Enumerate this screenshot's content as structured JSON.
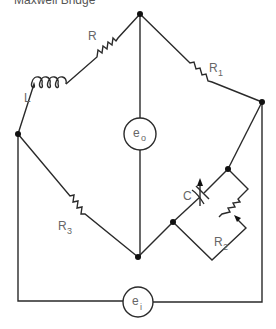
{
  "title": "Maxwell Bridge",
  "components": {
    "R": {
      "label": "R"
    },
    "L": {
      "label": "L"
    },
    "R1": {
      "label": "R",
      "sub": "1"
    },
    "R2": {
      "label": "R",
      "sub": "2"
    },
    "R3": {
      "label": "R",
      "sub": "3"
    },
    "C": {
      "label": "C"
    },
    "eo": {
      "label": "e",
      "sub": "o"
    },
    "ei": {
      "label": "e",
      "sub": "i"
    }
  },
  "colors": {
    "wire": "#2a2a2a",
    "label": "#666666",
    "node": "#111111"
  }
}
